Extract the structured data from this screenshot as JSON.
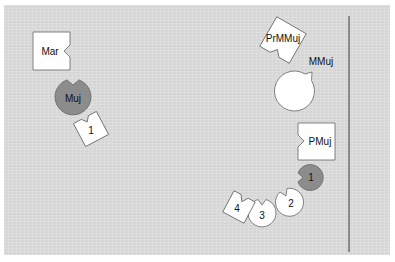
{
  "diagram": {
    "colors": {
      "background": "#d6d6d6",
      "white_shape": "#ffffff",
      "dark_shape": "#8c8c8c",
      "outline": "#555555",
      "line": "#555555"
    },
    "nodes": [
      {
        "id": "mar",
        "label": "Mar",
        "shape": "notched-square",
        "fill": "white"
      },
      {
        "id": "muj",
        "label": "Muj",
        "shape": "notched-circle",
        "fill": "dark"
      },
      {
        "id": "one_left",
        "label": "1",
        "shape": "notched-square-rotated",
        "fill": "white"
      },
      {
        "id": "prmmuj",
        "label": "PrMMuj",
        "shape": "notched-square-rotated",
        "fill": "white"
      },
      {
        "id": "mmuj",
        "label": "MMuj",
        "shape": "notched-circle",
        "fill": "white"
      },
      {
        "id": "pmuj",
        "label": "PMuj",
        "shape": "notched-square",
        "fill": "white"
      },
      {
        "id": "one_right",
        "label": "1",
        "shape": "notched-circle",
        "fill": "dark"
      },
      {
        "id": "two",
        "label": "2",
        "shape": "notched-circle",
        "fill": "white"
      },
      {
        "id": "three",
        "label": "3",
        "shape": "notched-circle",
        "fill": "white"
      },
      {
        "id": "four",
        "label": "4",
        "shape": "notched-square-rotated",
        "fill": "white"
      }
    ],
    "divider": "vertical-line"
  }
}
